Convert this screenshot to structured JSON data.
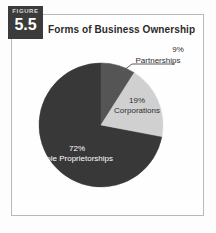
{
  "figure": {
    "label_word": "FIGURE",
    "number": "5.5",
    "badge_color": "#3b3b3b"
  },
  "chart_data": {
    "type": "pie",
    "title": "Forms of Business Ownership",
    "xlabel": "",
    "ylabel": "",
    "start_angle_deg": 0,
    "direction": "clockwise",
    "categories": [
      "Partnerships",
      "Corporations",
      "Sole Proprietorships"
    ],
    "values": [
      9,
      19,
      72
    ],
    "value_suffix": "%",
    "colors": [
      "#555555",
      "#d0d0d0",
      "#383838"
    ],
    "legend": "none",
    "grid": false,
    "slices": [
      {
        "name": "Partnerships",
        "value": 9,
        "percent_label": "9%",
        "name_label": "Partnerships",
        "color": "#555555",
        "label_placement": "outside",
        "label_color": "#2d2d2d",
        "has_leader_line": true
      },
      {
        "name": "Corporations",
        "value": 19,
        "percent_label": "19%",
        "name_label": "Corporations",
        "color": "#d0d0d0",
        "label_placement": "inside",
        "label_color": "#2d2d2d",
        "has_leader_line": false
      },
      {
        "name": "Sole Proprietorships",
        "value": 72,
        "percent_label": "72%",
        "name_label": "Sole Proprietorships",
        "color": "#383838",
        "label_placement": "inside",
        "label_color": "#ffffff",
        "has_leader_line": false
      }
    ]
  },
  "style": {
    "frame_border_color": "#b9b9b9",
    "background": "#fefefe"
  }
}
